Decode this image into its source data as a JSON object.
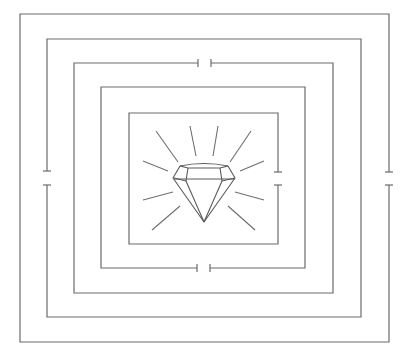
{
  "puzzle": {
    "title": "Diamond maze",
    "type": "concentric-square-maze",
    "goal_icon": "diamond-icon",
    "colors": {
      "background": "#ffffff",
      "walls": "#6b6b6b",
      "diamond": "#5a5a5a"
    },
    "rings": [
      {
        "id": 1,
        "name": "outer-ring",
        "box": [
          20,
          14,
          389,
          342
        ],
        "gap_side": "right",
        "gap": [
          172,
          185
        ]
      },
      {
        "id": 2,
        "name": "ring-2",
        "box": [
          47,
          39,
          361,
          317
        ],
        "gap_side": "left",
        "gap": [
          171,
          185
        ]
      },
      {
        "id": 3,
        "name": "ring-3",
        "box": [
          74,
          63,
          333,
          293
        ],
        "gap_side": "top",
        "gap": [
          198,
          211
        ]
      },
      {
        "id": 4,
        "name": "ring-4",
        "box": [
          101,
          87,
          305,
          268
        ],
        "gap_side": "bottom",
        "gap": [
          197,
          210
        ]
      },
      {
        "id": 5,
        "name": "inner-ring",
        "box": [
          129,
          113,
          278,
          244
        ],
        "gap_side": "right",
        "gap": [
          172,
          185
        ]
      }
    ]
  }
}
